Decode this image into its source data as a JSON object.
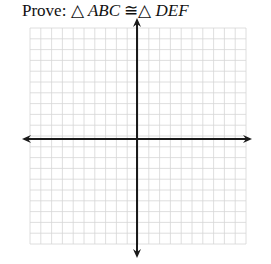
{
  "title": {
    "prefix": "Prove: ",
    "triangle_symbol": "△",
    "first": "ABC",
    "congruent_symbol": " ≅",
    "second": "DEF"
  },
  "grid": {
    "x_start": 30,
    "y_start": 28,
    "cell": 10.8,
    "cols": 20,
    "rows": 20,
    "line_color": "#d6d6d6",
    "major_every": 0
  },
  "axes": {
    "origin_x": 137,
    "origin_y": 139,
    "x_min": 22,
    "x_max": 252,
    "y_min": 18,
    "y_max": 258,
    "color": "#1a1a1a"
  }
}
